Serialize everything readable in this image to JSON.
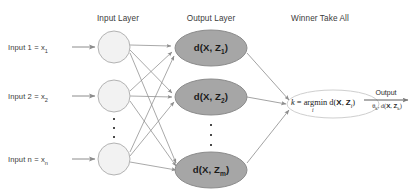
{
  "diagram": {
    "headers": [
      {
        "name": "input-layer-header",
        "label": "Input Layer",
        "x": 78,
        "y": 14,
        "w": 80
      },
      {
        "name": "output-layer-header",
        "label": "Output Layer",
        "x": 167,
        "y": 14,
        "w": 88
      },
      {
        "name": "winner-take-all-header",
        "label": "Winner Take All",
        "x": 268,
        "y": 14,
        "w": 104
      }
    ],
    "input_labels": [
      {
        "name": "input-1-label",
        "text": "Input 1  =  x",
        "sub": "1",
        "x": 8,
        "y": 43
      },
      {
        "name": "input-2-label",
        "text": "Input 2  =  x",
        "sub": "2",
        "x": 8,
        "y": 92
      },
      {
        "name": "input-n-label",
        "text": "Input n  =  x",
        "sub": "n",
        "x": 8,
        "y": 155
      }
    ],
    "input_nodes": [
      {
        "name": "input-node-1",
        "cx": 114,
        "cy": 47,
        "rx": 16,
        "ry": 16
      },
      {
        "name": "input-node-2",
        "cx": 114,
        "cy": 96,
        "rx": 16,
        "ry": 16
      },
      {
        "name": "input-node-n",
        "cx": 114,
        "cy": 159,
        "rx": 16,
        "ry": 16
      }
    ],
    "input_ellipsis": {
      "name": "input-vertical-ellipsis",
      "x": 112,
      "y": 118,
      "dots": 3
    },
    "output_nodes": [
      {
        "name": "output-node-1",
        "label": "d(X, Z",
        "sub": "1",
        "tail": ")",
        "cx": 211,
        "cy": 48,
        "rx": 36,
        "ry": 18
      },
      {
        "name": "output-node-2",
        "label": "d(X, Z",
        "sub": "2",
        "tail": ")",
        "cx": 211,
        "cy": 97,
        "rx": 36,
        "ry": 18
      },
      {
        "name": "output-node-m",
        "label": "d(X, Z",
        "sub": "m",
        "tail": ")",
        "cx": 211,
        "cy": 170,
        "rx": 36,
        "ry": 18
      }
    ],
    "output_ellipsis": {
      "name": "output-vertical-ellipsis",
      "x": 209,
      "y": 124,
      "dots": 3
    },
    "wta": {
      "name": "winner-take-all-node",
      "cx": 333,
      "cy": 104,
      "rx": 46,
      "ry": 14,
      "formula_k": "k",
      "formula_eq": " = ",
      "formula_argmin": "argmin",
      "formula_d": " d(",
      "formula_X": "X",
      "formula_comma": ", ",
      "formula_Z": "Z",
      "formula_sub": "i",
      "formula_close": ")",
      "argmin_index": "i"
    },
    "output_arrow": {
      "name": "output-arrow",
      "top_label": "Output",
      "bottom_theta": "θ",
      "bottom_sub_k": "k",
      "bottom_mid": ", d(",
      "bottom_X": "X",
      "bottom_comma": ", ",
      "bottom_Z": "Z",
      "bottom_sub_k2": "k",
      "bottom_close": ")"
    },
    "colors": {
      "output_node_fill": "#a6a6a6",
      "output_node_stroke": "#8c8c8c",
      "input_node_fill": "#f2f2f2",
      "input_node_stroke": "#b3b3b3",
      "edge": "#8c8c8c",
      "text": "#3b3b3b",
      "wta_stroke": "#cfcfcf",
      "background": "#ffffff"
    },
    "edges": [
      {
        "from": "input-node-1",
        "to": "output-node-1"
      },
      {
        "from": "input-node-1",
        "to": "output-node-2"
      },
      {
        "from": "input-node-1",
        "to": "output-node-m"
      },
      {
        "from": "input-node-2",
        "to": "output-node-1"
      },
      {
        "from": "input-node-2",
        "to": "output-node-2"
      },
      {
        "from": "input-node-2",
        "to": "output-node-m"
      },
      {
        "from": "input-node-n",
        "to": "output-node-1"
      },
      {
        "from": "input-node-n",
        "to": "output-node-2"
      },
      {
        "from": "input-node-n",
        "to": "output-node-m"
      },
      {
        "from": "output-node-1",
        "to": "winner-take-all-node"
      },
      {
        "from": "output-node-2",
        "to": "winner-take-all-node"
      },
      {
        "from": "output-node-m",
        "to": "winner-take-all-node"
      }
    ]
  }
}
